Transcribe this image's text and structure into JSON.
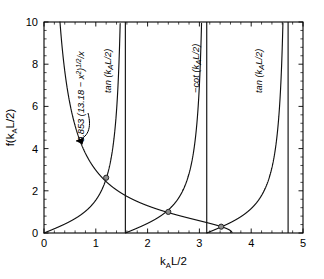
{
  "chart_data": {
    "type": "line",
    "title": "",
    "xlabel": "k_A L/2",
    "ylabel": "f(k_A L/2)",
    "xlabel_parts": {
      "base1": "k",
      "sub": "A",
      "base2": "L/2"
    },
    "ylabel_parts": {
      "pre": "f(k",
      "sub": "A",
      "post": "L/2)"
    },
    "xlim": [
      0,
      5
    ],
    "ylim": [
      0,
      10
    ],
    "xticks": [
      0,
      1,
      2,
      3,
      4,
      5
    ],
    "xticklabels": [
      "0",
      "1",
      "2",
      "3",
      "4",
      "5"
    ],
    "yticks": [
      0,
      2,
      4,
      6,
      8,
      10
    ],
    "yticklabels": [
      "0",
      "2",
      "4",
      "6",
      "8",
      "10"
    ],
    "x_minor_per_interval": 5,
    "y_minor_per_interval": 5,
    "grid": false,
    "legend_position": "none",
    "constant_prefactor": 0.853,
    "constant_inside": 13.18,
    "asymptotes": [
      1.5708,
      3.1416,
      4.7124
    ],
    "series": [
      {
        "name": "circle-function",
        "label": "0.853 (13.18 - x^2)^(1/2)/x",
        "label_parts": {
          "a": "0.853 (13.18 − x",
          "sup1": "2",
          "b": ")",
          "sup2": "1/2",
          "c": "/x"
        },
        "type": "decreasing",
        "x_end": 3.6304
      },
      {
        "name": "tan-branch-1",
        "label": "tan (k_A L/2)",
        "label_parts": {
          "pre": "tan (k",
          "sub": "A",
          "post": "L/2)"
        },
        "branch_start": 0.0,
        "branch_end": 1.5708
      },
      {
        "name": "neg-cot-branch",
        "label": "-cot (k_A L/2)",
        "label_parts": {
          "pre": "−cot (k",
          "sub": "A",
          "post": "L/2)"
        },
        "branch_start": 1.5708,
        "branch_end": 3.1416
      },
      {
        "name": "tan-branch-2",
        "label": "tan (k_A L/2)",
        "label_parts": {
          "pre": "tan (k",
          "sub": "A",
          "post": "L/2)"
        },
        "branch_start": 3.1416,
        "branch_end": 4.7124
      },
      {
        "name": "tan-branch-3",
        "branch_start": 4.7124,
        "branch_end": 5.0
      }
    ],
    "intersections": [
      {
        "x": 1.2,
        "y": 2.62
      },
      {
        "x": 2.4,
        "y": 1.0
      },
      {
        "x": 3.42,
        "y": 0.3
      }
    ],
    "annotations": [
      {
        "name": "circle-function-label",
        "text": "0.853 (13.18 - x^2)^(1/2)/x",
        "rotation": -90
      },
      {
        "name": "tan-label-left",
        "text": "tan (k_A L/2)",
        "rotation": -90
      },
      {
        "name": "negcot-label",
        "text": "-cot (k_A L/2)",
        "rotation": -90
      },
      {
        "name": "tan-label-right",
        "text": "tan (k_A L/2)",
        "rotation": -90
      }
    ]
  },
  "axes": {
    "x_title": "k",
    "x_title_sub": "A",
    "x_title_end": "L/2",
    "y_title": "f(k",
    "y_title_sub": "A",
    "y_title_end": "L/2)",
    "xtick_0": "0",
    "xtick_1": "1",
    "xtick_2": "2",
    "xtick_3": "3",
    "xtick_4": "4",
    "xtick_5": "5",
    "ytick_0": "0",
    "ytick_2": "2",
    "ytick_4": "4",
    "ytick_6": "6",
    "ytick_8": "8",
    "ytick_10": "10"
  },
  "labels": {
    "circle_a": "0.853 (13.18 − x",
    "circle_sup1": "2",
    "circle_b": ")",
    "circle_sup2": "1/2",
    "circle_c": "/x",
    "tan_pre": "tan (k",
    "tan_sub": "A",
    "tan_post": "L/2)",
    "negcot_pre": "−cot (k",
    "negcot_sub": "A",
    "negcot_post": "L/2)"
  }
}
